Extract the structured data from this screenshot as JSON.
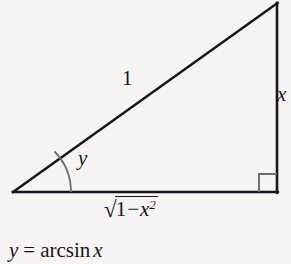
{
  "figure": {
    "name": "right-triangle-arcsin-diagram",
    "background_color": "#f6f5f3",
    "stroke_color": "#16161a",
    "labels": {
      "hypotenuse": "1",
      "opposite_side": "x",
      "angle": "y",
      "adjacent_side_radical": "√",
      "adjacent_side_radicand_one": "1",
      "adjacent_side_radicand_minus": "−",
      "adjacent_side_radicand_var": "x",
      "adjacent_side_radicand_exponent": "2"
    },
    "equation": {
      "lhs": "y",
      "equals": "=",
      "function": "arcsin",
      "argument": "x"
    },
    "geometry": {
      "left_vertex": [
        13,
        192
      ],
      "right_vertex": [
        277,
        192
      ],
      "apex": [
        277,
        3
      ],
      "right_angle_marker_size": 18,
      "angle_arc_radius": 58
    }
  }
}
